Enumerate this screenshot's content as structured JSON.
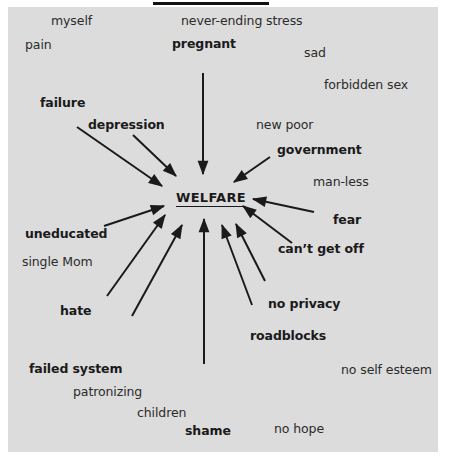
{
  "diagram": {
    "center": {
      "label": "WELFARE",
      "x": 176,
      "y": 190
    },
    "words": [
      {
        "id": "myself",
        "label": "myself",
        "x": 51,
        "y": 13,
        "bold": false
      },
      {
        "id": "never-ending-stress",
        "label": "never-ending stress",
        "x": 181,
        "y": 13,
        "bold": false
      },
      {
        "id": "pain",
        "label": "pain",
        "x": 25,
        "y": 37,
        "bold": false
      },
      {
        "id": "pregnant",
        "label": "pregnant",
        "x": 172,
        "y": 36,
        "bold": true
      },
      {
        "id": "sad",
        "label": "sad",
        "x": 304,
        "y": 45,
        "bold": false
      },
      {
        "id": "forbidden-sex",
        "label": "forbidden sex",
        "x": 324,
        "y": 77,
        "bold": false
      },
      {
        "id": "failure",
        "label": "failure",
        "x": 40,
        "y": 95,
        "bold": true
      },
      {
        "id": "depression",
        "label": "depression",
        "x": 88,
        "y": 117,
        "bold": true
      },
      {
        "id": "new-poor",
        "label": "new poor",
        "x": 256,
        "y": 117,
        "bold": false
      },
      {
        "id": "government",
        "label": "government",
        "x": 277,
        "y": 142,
        "bold": true
      },
      {
        "id": "man-less",
        "label": "man-less",
        "x": 313,
        "y": 174,
        "bold": false
      },
      {
        "id": "fear",
        "label": "fear",
        "x": 333,
        "y": 212,
        "bold": true
      },
      {
        "id": "uneducated",
        "label": "uneducated",
        "x": 25,
        "y": 226,
        "bold": true
      },
      {
        "id": "cant-get-off",
        "label": "can’t get off",
        "x": 278,
        "y": 241,
        "bold": true
      },
      {
        "id": "single-mom",
        "label": "single Mom",
        "x": 22,
        "y": 254,
        "bold": false
      },
      {
        "id": "hate",
        "label": "hate",
        "x": 60,
        "y": 303,
        "bold": true
      },
      {
        "id": "no-privacy",
        "label": "no privacy",
        "x": 268,
        "y": 296,
        "bold": true
      },
      {
        "id": "roadblocks",
        "label": "roadblocks",
        "x": 250,
        "y": 328,
        "bold": true
      },
      {
        "id": "failed-system",
        "label": "failed system",
        "x": 29,
        "y": 361,
        "bold": true
      },
      {
        "id": "no-self-esteem",
        "label": "no self esteem",
        "x": 341,
        "y": 362,
        "bold": false
      },
      {
        "id": "patronizing",
        "label": "patronizing",
        "x": 73,
        "y": 384,
        "bold": false
      },
      {
        "id": "children",
        "label": "children",
        "x": 137,
        "y": 405,
        "bold": false
      },
      {
        "id": "shame",
        "label": "shame",
        "x": 185,
        "y": 423,
        "bold": true
      },
      {
        "id": "no-hope",
        "label": "no hope",
        "x": 274,
        "y": 421,
        "bold": false
      }
    ],
    "arrows": [
      {
        "from": "pregnant",
        "x1": 203,
        "y1": 73,
        "x2": 203,
        "y2": 174
      },
      {
        "from": "depression",
        "x1": 133,
        "y1": 135,
        "x2": 176,
        "y2": 176
      },
      {
        "from": "failure",
        "x1": 77,
        "y1": 127,
        "x2": 162,
        "y2": 186
      },
      {
        "from": "government",
        "x1": 270,
        "y1": 157,
        "x2": 234,
        "y2": 182
      },
      {
        "from": "fear",
        "x1": 314,
        "y1": 212,
        "x2": 253,
        "y2": 199
      },
      {
        "from": "cant-get-off",
        "x1": 292,
        "y1": 243,
        "x2": 243,
        "y2": 206
      },
      {
        "from": "uneducated",
        "x1": 104,
        "y1": 226,
        "x2": 164,
        "y2": 206
      },
      {
        "from": "hate-upper",
        "x1": 107,
        "y1": 296,
        "x2": 165,
        "y2": 215
      },
      {
        "from": "hate-lower",
        "x1": 132,
        "y1": 316,
        "x2": 182,
        "y2": 225
      },
      {
        "from": "shame",
        "x1": 204,
        "y1": 364,
        "x2": 204,
        "y2": 219
      },
      {
        "from": "no-privacy",
        "x1": 252,
        "y1": 305,
        "x2": 222,
        "y2": 225
      },
      {
        "from": "roadblocks",
        "x1": 265,
        "y1": 281,
        "x2": 236,
        "y2": 224
      }
    ]
  }
}
